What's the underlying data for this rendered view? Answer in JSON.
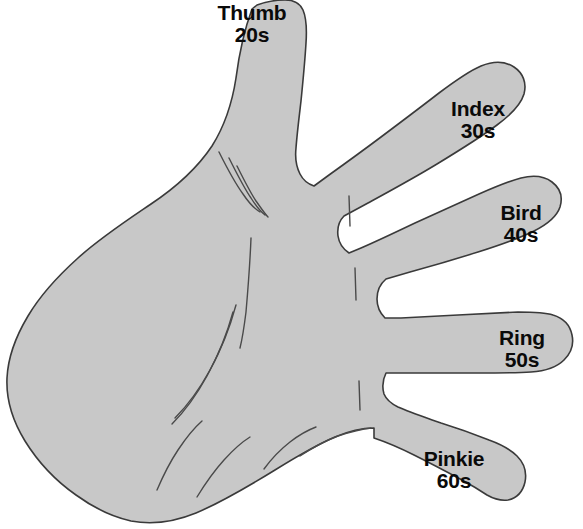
{
  "diagram": {
    "background_color": "#ffffff",
    "hand": {
      "fill_color": "#c8c8c8",
      "outline_color": "#3a3a3a",
      "crease_color": "#4a4a4a",
      "orientation": "palm-facing-viewer",
      "hand_side": "left"
    },
    "label_color": "#0a0a0a",
    "fingers": [
      {
        "id": "thumb",
        "name": "Thumb",
        "time": "20s",
        "seconds": 20
      },
      {
        "id": "index",
        "name": "Index",
        "time": "30s",
        "seconds": 30
      },
      {
        "id": "bird",
        "name": "Bird",
        "time": "40s",
        "seconds": 40
      },
      {
        "id": "ring",
        "name": "Ring",
        "time": "50s",
        "seconds": 50
      },
      {
        "id": "pinkie",
        "name": "Pinkie",
        "time": "60s",
        "seconds": 60
      }
    ]
  }
}
